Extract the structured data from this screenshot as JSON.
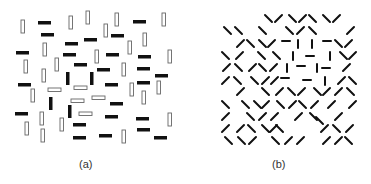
{
  "figure": {
    "panels": [
      {
        "id": "a",
        "label": "(a)"
      },
      {
        "id": "b",
        "label": "(b)"
      }
    ],
    "colors": {
      "stroke": "#111111",
      "outline": "#666666",
      "background": "#ffffff",
      "label": "#333333"
    }
  },
  "panel_a": {
    "description": "Texture of black filled bars and open outlined bars; a square figure formed by vertical black bars and horizontal open bars in center",
    "elements": [
      {
        "type": "open-v",
        "x": 21,
        "y": 20
      },
      {
        "type": "black-h",
        "x": 38,
        "y": 21
      },
      {
        "type": "open-v",
        "x": 69,
        "y": 16
      },
      {
        "type": "open-v",
        "x": 86,
        "y": 11
      },
      {
        "type": "open-v",
        "x": 115,
        "y": 13
      },
      {
        "type": "black-h",
        "x": 133,
        "y": 20
      },
      {
        "type": "open-v",
        "x": 162,
        "y": 13
      },
      {
        "type": "black-h",
        "x": 41,
        "y": 33
      },
      {
        "type": "black-h",
        "x": 84,
        "y": 38
      },
      {
        "type": "open-v",
        "x": 104,
        "y": 24
      },
      {
        "type": "black-h",
        "x": 111,
        "y": 34
      },
      {
        "type": "black-h",
        "x": 16,
        "y": 51
      },
      {
        "type": "open-v",
        "x": 43,
        "y": 43
      },
      {
        "type": "black-h",
        "x": 65,
        "y": 42
      },
      {
        "type": "open-v",
        "x": 128,
        "y": 41
      },
      {
        "type": "open-v",
        "x": 143,
        "y": 33
      },
      {
        "type": "black-h",
        "x": 106,
        "y": 53
      },
      {
        "type": "black-h",
        "x": 138,
        "y": 55
      },
      {
        "type": "open-v",
        "x": 168,
        "y": 50
      },
      {
        "type": "black-h",
        "x": 63,
        "y": 53
      },
      {
        "type": "open-v",
        "x": 95,
        "y": 50
      },
      {
        "type": "open-v",
        "x": 24,
        "y": 60
      },
      {
        "type": "open-v",
        "x": 42,
        "y": 69
      },
      {
        "type": "open-v",
        "x": 55,
        "y": 58
      },
      {
        "type": "black-h",
        "x": 74,
        "y": 63
      },
      {
        "type": "black-h",
        "x": 97,
        "y": 68
      },
      {
        "type": "open-v",
        "x": 122,
        "y": 63
      },
      {
        "type": "black-h",
        "x": 137,
        "y": 67
      },
      {
        "type": "black-h",
        "x": 155,
        "y": 74
      },
      {
        "type": "black-v",
        "x": 66,
        "y": 72
      },
      {
        "type": "black-v",
        "x": 90,
        "y": 72
      },
      {
        "type": "open-h",
        "x": 74,
        "y": 86
      },
      {
        "type": "black-h",
        "x": 18,
        "y": 83
      },
      {
        "type": "black-h",
        "x": 105,
        "y": 83
      },
      {
        "type": "black-h",
        "x": 137,
        "y": 81
      },
      {
        "type": "open-v",
        "x": 130,
        "y": 83
      },
      {
        "type": "open-v",
        "x": 142,
        "y": 91
      },
      {
        "type": "open-v",
        "x": 157,
        "y": 81
      },
      {
        "type": "open-v",
        "x": 31,
        "y": 89
      },
      {
        "type": "open-h",
        "x": 48,
        "y": 88
      },
      {
        "type": "black-v",
        "x": 49,
        "y": 97
      },
      {
        "type": "open-h",
        "x": 71,
        "y": 99
      },
      {
        "type": "open-h",
        "x": 92,
        "y": 96
      },
      {
        "type": "black-h",
        "x": 110,
        "y": 102
      },
      {
        "type": "black-h",
        "x": 15,
        "y": 112
      },
      {
        "type": "open-v",
        "x": 40,
        "y": 112
      },
      {
        "type": "black-v",
        "x": 68,
        "y": 105
      },
      {
        "type": "open-h",
        "x": 79,
        "y": 112
      },
      {
        "type": "black-h",
        "x": 105,
        "y": 115
      },
      {
        "type": "black-h",
        "x": 136,
        "y": 117
      },
      {
        "type": "open-v",
        "x": 168,
        "y": 113
      },
      {
        "type": "open-v",
        "x": 25,
        "y": 122
      },
      {
        "type": "open-v",
        "x": 60,
        "y": 118
      },
      {
        "type": "black-h",
        "x": 73,
        "y": 123
      },
      {
        "type": "black-h",
        "x": 137,
        "y": 128
      },
      {
        "type": "open-v",
        "x": 122,
        "y": 130
      },
      {
        "type": "open-v",
        "x": 41,
        "y": 129
      },
      {
        "type": "black-h",
        "x": 73,
        "y": 136
      },
      {
        "type": "black-h",
        "x": 99,
        "y": 134
      },
      {
        "type": "black-h",
        "x": 154,
        "y": 136
      }
    ]
  },
  "panel_b": {
    "description": "Texture of short oblique line segments; a square figure formed by horizontal and vertical segments in center",
    "segments": [
      {
        "o": "\\",
        "x": 265,
        "y": 15
      },
      {
        "o": "/",
        "x": 275,
        "y": 15
      },
      {
        "o": "\\",
        "x": 289,
        "y": 15
      },
      {
        "o": "/",
        "x": 299,
        "y": 15
      },
      {
        "o": "\\",
        "x": 309,
        "y": 15
      },
      {
        "o": "\\",
        "x": 323,
        "y": 15
      },
      {
        "o": "/",
        "x": 333,
        "y": 15
      },
      {
        "o": "\\",
        "x": 224,
        "y": 27
      },
      {
        "o": "\\",
        "x": 235,
        "y": 27
      },
      {
        "o": "\\",
        "x": 259,
        "y": 27
      },
      {
        "o": "\\",
        "x": 286,
        "y": 27
      },
      {
        "o": "/",
        "x": 297,
        "y": 27
      },
      {
        "o": "\\",
        "x": 309,
        "y": 27
      },
      {
        "o": "/",
        "x": 347,
        "y": 27
      },
      {
        "o": "/",
        "x": 237,
        "y": 40
      },
      {
        "o": "\\",
        "x": 247,
        "y": 40
      },
      {
        "o": "\\",
        "x": 259,
        "y": 40
      },
      {
        "o": "/",
        "x": 268,
        "y": 40
      },
      {
        "o": "-",
        "x": 282,
        "y": 41
      },
      {
        "o": "|",
        "x": 298,
        "y": 40
      },
      {
        "o": "|",
        "x": 312,
        "y": 40
      },
      {
        "o": "-",
        "x": 323,
        "y": 41
      },
      {
        "o": "\\",
        "x": 335,
        "y": 40
      },
      {
        "o": "/",
        "x": 345,
        "y": 40
      },
      {
        "o": "\\",
        "x": 222,
        "y": 52
      },
      {
        "o": "/",
        "x": 236,
        "y": 52
      },
      {
        "o": "\\",
        "x": 258,
        "y": 52
      },
      {
        "o": "\\",
        "x": 273,
        "y": 52
      },
      {
        "o": "|",
        "x": 293,
        "y": 52
      },
      {
        "o": "-",
        "x": 306,
        "y": 56
      },
      {
        "o": "|",
        "x": 330,
        "y": 52
      },
      {
        "o": "\\",
        "x": 340,
        "y": 52
      },
      {
        "o": "/",
        "x": 349,
        "y": 52
      },
      {
        "o": "/",
        "x": 223,
        "y": 64
      },
      {
        "o": "\\",
        "x": 235,
        "y": 64
      },
      {
        "o": "/",
        "x": 249,
        "y": 64
      },
      {
        "o": "\\",
        "x": 259,
        "y": 64
      },
      {
        "o": "/",
        "x": 270,
        "y": 64
      },
      {
        "o": "|",
        "x": 287,
        "y": 64
      },
      {
        "o": "-",
        "x": 297,
        "y": 66
      },
      {
        "o": "|",
        "x": 317,
        "y": 64
      },
      {
        "o": "-",
        "x": 322,
        "y": 68
      },
      {
        "o": "/",
        "x": 343,
        "y": 64
      },
      {
        "o": "/",
        "x": 222,
        "y": 77
      },
      {
        "o": "\\",
        "x": 234,
        "y": 77
      },
      {
        "o": "\\",
        "x": 251,
        "y": 77
      },
      {
        "o": "/",
        "x": 262,
        "y": 77
      },
      {
        "o": "/",
        "x": 271,
        "y": 77
      },
      {
        "o": "-",
        "x": 281,
        "y": 78
      },
      {
        "o": "-",
        "x": 303,
        "y": 80
      },
      {
        "o": "|",
        "x": 325,
        "y": 77
      },
      {
        "o": "/",
        "x": 338,
        "y": 77
      },
      {
        "o": "\\",
        "x": 349,
        "y": 77
      },
      {
        "o": "/",
        "x": 237,
        "y": 88
      },
      {
        "o": "\\",
        "x": 262,
        "y": 88
      },
      {
        "o": "/",
        "x": 276,
        "y": 88
      },
      {
        "o": "\\",
        "x": 288,
        "y": 88
      },
      {
        "o": "/",
        "x": 298,
        "y": 88
      },
      {
        "o": "\\",
        "x": 314,
        "y": 88
      },
      {
        "o": "/",
        "x": 323,
        "y": 88
      },
      {
        "o": "/",
        "x": 335,
        "y": 88
      },
      {
        "o": "\\",
        "x": 347,
        "y": 88
      },
      {
        "o": "\\",
        "x": 222,
        "y": 101
      },
      {
        "o": "\\",
        "x": 242,
        "y": 101
      },
      {
        "o": "\\",
        "x": 254,
        "y": 101
      },
      {
        "o": "/",
        "x": 262,
        "y": 101
      },
      {
        "o": "\\",
        "x": 277,
        "y": 101
      },
      {
        "o": "/",
        "x": 289,
        "y": 101
      },
      {
        "o": "\\",
        "x": 299,
        "y": 101
      },
      {
        "o": "/",
        "x": 311,
        "y": 101
      },
      {
        "o": "/",
        "x": 328,
        "y": 101
      },
      {
        "o": "/",
        "x": 349,
        "y": 101
      },
      {
        "o": "/",
        "x": 222,
        "y": 113
      },
      {
        "o": "\\",
        "x": 247,
        "y": 113
      },
      {
        "o": "/",
        "x": 259,
        "y": 113
      },
      {
        "o": "/",
        "x": 271,
        "y": 113
      },
      {
        "o": "/",
        "x": 295,
        "y": 113
      },
      {
        "o": "\\",
        "x": 310,
        "y": 113
      },
      {
        "o": "\\",
        "x": 316,
        "y": 117
      },
      {
        "o": "/",
        "x": 335,
        "y": 113
      },
      {
        "o": "/",
        "x": 222,
        "y": 125
      },
      {
        "o": "/",
        "x": 237,
        "y": 125
      },
      {
        "o": "\\",
        "x": 248,
        "y": 125
      },
      {
        "o": "\\",
        "x": 262,
        "y": 125
      },
      {
        "o": "/",
        "x": 270,
        "y": 125
      },
      {
        "o": "\\",
        "x": 276,
        "y": 125
      },
      {
        "o": "/",
        "x": 321,
        "y": 125
      },
      {
        "o": "\\",
        "x": 333,
        "y": 125
      },
      {
        "o": "/",
        "x": 346,
        "y": 125
      },
      {
        "o": "\\",
        "x": 225,
        "y": 137
      },
      {
        "o": "\\",
        "x": 238,
        "y": 137
      },
      {
        "o": "/",
        "x": 249,
        "y": 137
      },
      {
        "o": "\\",
        "x": 272,
        "y": 137
      },
      {
        "o": "/",
        "x": 285,
        "y": 137
      },
      {
        "o": "/",
        "x": 297,
        "y": 137
      },
      {
        "o": "/",
        "x": 323,
        "y": 137
      },
      {
        "o": "/",
        "x": 335,
        "y": 137
      },
      {
        "o": "\\",
        "x": 345,
        "y": 137
      }
    ]
  }
}
